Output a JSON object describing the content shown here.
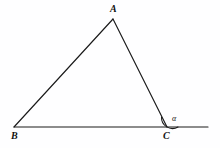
{
  "figure": {
    "kind": "geometry-diagram",
    "background_color": "#fefeff",
    "stroke_color": "#1a1a1a",
    "width": 220,
    "height": 148
  },
  "vertices": [
    {
      "id": "A",
      "label": "A",
      "x": 113,
      "y": 19
    },
    {
      "id": "B",
      "label": "B",
      "x": 14,
      "y": 127
    },
    {
      "id": "C",
      "label": "C",
      "x": 167,
      "y": 127
    }
  ],
  "segments": [
    {
      "id": "AB",
      "from": "B",
      "to": "A",
      "path": "M 14 127 L 113 19"
    },
    {
      "id": "AC",
      "from": "A",
      "to": "C",
      "path": "M 113 19 L 167 127"
    },
    {
      "id": "baseline",
      "from": "B",
      "to": "ray-end",
      "path": "M 14 127 L 208 127"
    }
  ],
  "angle_marks": [
    {
      "id": "alpha-at-C",
      "label": "α",
      "vertex": "C",
      "radius": 11,
      "arc_path": "M 161.5 117 A 11 11 0 0 0 178 127",
      "note": "exterior angle at C between side CA and the extension of BC"
    }
  ],
  "labels": {
    "apex": "A",
    "bottom_left": "B",
    "bottom_right": "C",
    "angle": "α"
  }
}
